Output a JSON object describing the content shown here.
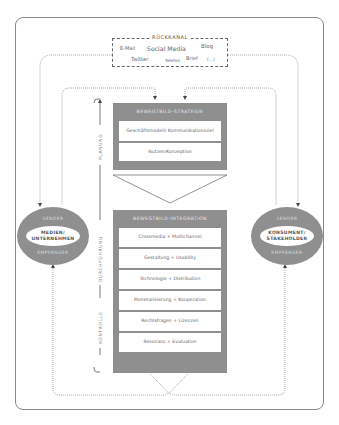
{
  "rueckkanal": {
    "title": "RÜCKKANAL",
    "channels": [
      "E-Mail",
      "Social Media",
      "Blog",
      "Twitter",
      "Telefon",
      "Brief",
      "(...)"
    ]
  },
  "strategie": {
    "title": "BEWEGTBILD-STRATEGIE",
    "items": [
      "Geschäftsmodell/ Kommunikationsziel",
      "Nutzen/Konzeption"
    ]
  },
  "integration": {
    "title": "BEWEGTBILD-INTEGRATION",
    "items": [
      "Crossmedia + Multichannel",
      "Gestaltung + Usability",
      "Technologie + Distribution",
      "Monetarisierung + Kooperation",
      "Rechtsfragen + Lizenzen",
      "Resonanz + Evaluation"
    ]
  },
  "left_node": {
    "top": "SENDER",
    "label": "MEDIEN/ UNTERNEHMEN",
    "bottom": "EMPFÄNGER"
  },
  "right_node": {
    "top": "SENDER",
    "label": "KONSUMENT/ STAKEHOLDER",
    "bottom": "EMPFÄNGER"
  },
  "phases": {
    "planung": "PLANUNG",
    "durchfuehrung": "DURCHFÜHRUNG",
    "kontrolle": "KONTROLLE"
  },
  "colors": {
    "box_gray": "#8f8f8f",
    "line": "#666666",
    "frame": "#8a8a8a"
  }
}
